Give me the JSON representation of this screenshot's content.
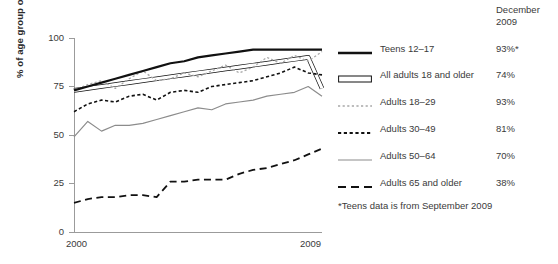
{
  "chart_data": {
    "type": "line",
    "title": "",
    "xlabel": "",
    "ylabel": "% of age group online",
    "xlim": [
      2000,
      2009
    ],
    "ylim": [
      0,
      100
    ],
    "yticks": [
      0,
      25,
      50,
      75,
      100
    ],
    "xticks": [
      "2000",
      "2009"
    ],
    "grid": false,
    "legend_position": "right",
    "legend_header": "December\n2009",
    "annotation": "*Teens data is from September 2009",
    "x": [
      2000.0,
      2000.5,
      2001.0,
      2001.5,
      2002.0,
      2002.5,
      2003.0,
      2003.5,
      2004.0,
      2004.5,
      2005.0,
      2005.5,
      2006.0,
      2006.5,
      2007.0,
      2007.5,
      2008.0,
      2008.5,
      2009.0
    ],
    "series": [
      {
        "name": "Teens 12-17",
        "style": "solid-thick-black",
        "color": "#111111",
        "december_2009": "93%*",
        "values": [
          73,
          75,
          77,
          79,
          81,
          83,
          85,
          87,
          88,
          90,
          91,
          92,
          93,
          94,
          94,
          94,
          94,
          94,
          94
        ]
      },
      {
        "name": "All adults 18 and older",
        "style": "hollow-band",
        "color": "#ffffff",
        "december_2009": "74%",
        "values": [
          73,
          74,
          75,
          76,
          77,
          78,
          79,
          80,
          81,
          82,
          83,
          84,
          85,
          86,
          87,
          88,
          89,
          90,
          74
        ]
      },
      {
        "name": "Adults 18-29",
        "style": "dotted-light-gray",
        "color": "#a8a8a8",
        "december_2009": "93%",
        "values": [
          73,
          76,
          78,
          74,
          79,
          83,
          78,
          79,
          82,
          80,
          83,
          86,
          82,
          85,
          90,
          87,
          91,
          88,
          93
        ]
      },
      {
        "name": "Adults 30-49",
        "style": "dashed-short-black",
        "color": "#111111",
        "december_2009": "81%",
        "values": [
          62,
          66,
          68,
          67,
          70,
          71,
          68,
          72,
          73,
          72,
          75,
          76,
          77,
          78,
          80,
          82,
          85,
          82,
          81
        ]
      },
      {
        "name": "Adults 50-64",
        "style": "solid-thin-gray",
        "color": "#8c8c8c",
        "december_2009": "70%",
        "values": [
          49,
          57,
          52,
          55,
          55,
          56,
          58,
          60,
          62,
          64,
          63,
          66,
          67,
          68,
          70,
          71,
          72,
          75,
          70
        ]
      },
      {
        "name": "Adults 65 and older",
        "style": "dashed-long-black",
        "color": "#111111",
        "december_2009": "38%",
        "values": [
          15,
          17,
          18,
          18,
          19,
          19,
          18,
          26,
          26,
          27,
          27,
          27,
          30,
          32,
          33,
          35,
          37,
          40,
          43
        ]
      }
    ]
  },
  "axis": {
    "ylabel": "% of age group online",
    "ytick_100": "100",
    "ytick_75": "75",
    "ytick_50": "50",
    "ytick_25": "25",
    "ytick_0": "0",
    "xtick_start": "2000",
    "xtick_end": "2009"
  },
  "legend": {
    "header_line1": "December",
    "header_line2": "2009",
    "items": [
      {
        "label": "Teens 12–17",
        "value": "93%*"
      },
      {
        "label": "All adults 18 and older",
        "value": "74%"
      },
      {
        "label": "Adults 18–29",
        "value": "93%"
      },
      {
        "label": "Adults 30–49",
        "value": "81%"
      },
      {
        "label": "Adults 50–64",
        "value": "70%"
      },
      {
        "label": "Adults 65 and older",
        "value": "38%"
      }
    ],
    "footnote": "*Teens data is from September 2009"
  },
  "colors": {
    "black": "#111111",
    "gray_line": "#8c8c8c",
    "light_gray_dotted": "#a8a8a8",
    "axis": "#9b9b9b",
    "text": "#3a3a3a"
  }
}
